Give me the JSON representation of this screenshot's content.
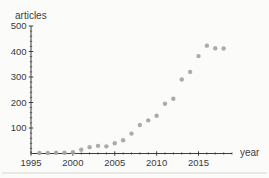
{
  "chart_data": {
    "type": "scatter",
    "title": "",
    "xlabel": "year",
    "ylabel": "articles",
    "series": [
      {
        "name": "articles per year",
        "x": [
          1996,
          1997,
          1998,
          1999,
          2000,
          2001,
          2002,
          2003,
          2004,
          2005,
          2006,
          2007,
          2008,
          2009,
          2010,
          2011,
          2012,
          2013,
          2014,
          2015,
          2016,
          2017,
          2018
        ],
        "y": [
          2,
          2,
          3,
          3,
          5,
          15,
          25,
          30,
          28,
          40,
          52,
          78,
          112,
          130,
          148,
          195,
          215,
          290,
          320,
          382,
          423,
          413,
          412
        ]
      }
    ],
    "xlim": [
      1995,
      2019
    ],
    "ylim": [
      0,
      500
    ],
    "x_major_ticks": [
      1995,
      2000,
      2005,
      2010,
      2015
    ],
    "x_minor_tick_step": 1,
    "y_major_ticks": [
      100,
      200,
      300,
      400,
      500
    ],
    "y_minor_tick_step": 20,
    "grid": false,
    "legend": null,
    "point_color": "#a6a6a6",
    "axis_color": "#3d3d3d",
    "label_color": "#3a3a3a"
  }
}
